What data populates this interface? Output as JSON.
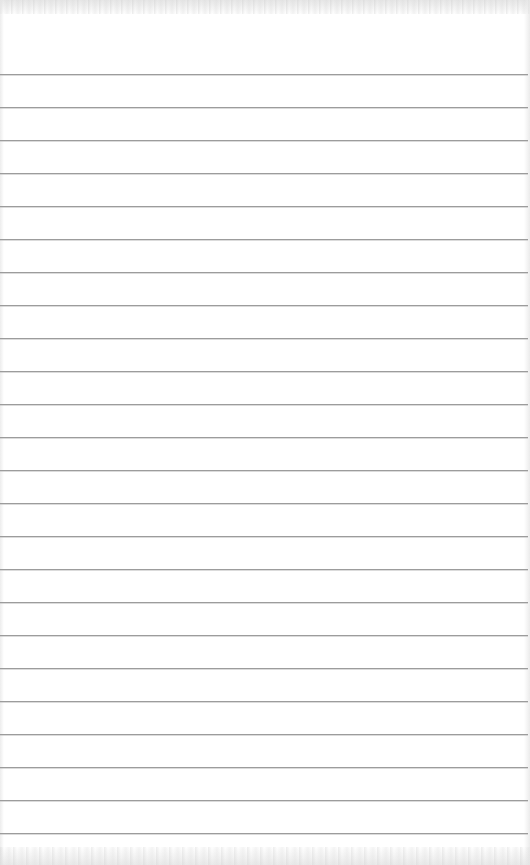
{
  "page": {
    "type": "ruled-notepad-sheet",
    "width": 530,
    "height": 865,
    "background_color": "#ffffff"
  },
  "rules": {
    "count": 24,
    "first_y": 74,
    "spacing": 33,
    "color": "#9c9c9c",
    "thickness": 1,
    "lines": [
      74,
      107,
      140,
      173,
      206,
      239,
      272,
      305,
      338,
      371,
      404,
      437,
      470,
      503,
      536,
      569,
      602,
      635,
      668,
      701,
      734,
      767,
      800,
      833
    ]
  },
  "text_content": []
}
